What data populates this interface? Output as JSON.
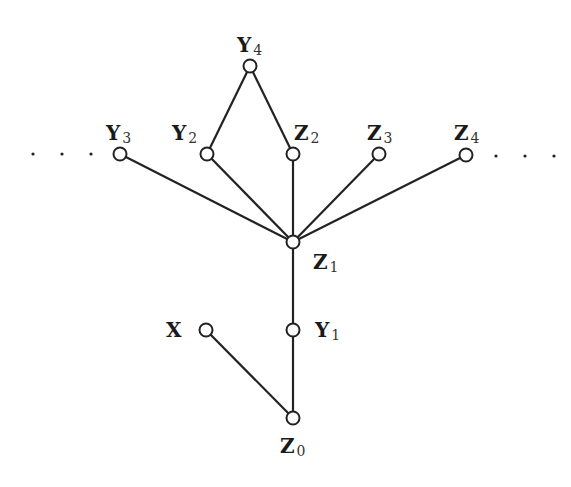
{
  "diagram": {
    "type": "graph",
    "nodes": [
      {
        "id": "Y4",
        "base": "Y",
        "sub": "4",
        "x": 250,
        "y": 66,
        "label_pos": "above"
      },
      {
        "id": "Y3",
        "base": "Y",
        "sub": "3",
        "x": 120,
        "y": 154,
        "label_pos": "above"
      },
      {
        "id": "Y2",
        "base": "Y",
        "sub": "2",
        "x": 207,
        "y": 154,
        "label_pos": "above"
      },
      {
        "id": "Z2",
        "base": "Z",
        "sub": "2",
        "x": 293,
        "y": 154,
        "label_pos": "above"
      },
      {
        "id": "Z3",
        "base": "Z",
        "sub": "3",
        "x": 379,
        "y": 154,
        "label_pos": "above"
      },
      {
        "id": "Z4",
        "base": "Z",
        "sub": "4",
        "x": 466,
        "y": 155,
        "label_pos": "above"
      },
      {
        "id": "Z1",
        "base": "Z",
        "sub": "1",
        "x": 293,
        "y": 242,
        "label_pos": "below-right"
      },
      {
        "id": "X",
        "base": "X",
        "sub": "",
        "x": 206,
        "y": 330,
        "label_pos": "left"
      },
      {
        "id": "Y1",
        "base": "Y",
        "sub": "1",
        "x": 293,
        "y": 330,
        "label_pos": "right"
      },
      {
        "id": "Z0",
        "base": "Z",
        "sub": "0",
        "x": 293,
        "y": 418,
        "label_pos": "below"
      }
    ],
    "edges": [
      [
        "Y4",
        "Y2"
      ],
      [
        "Y4",
        "Z2"
      ],
      [
        "Y3",
        "Z1"
      ],
      [
        "Y2",
        "Z1"
      ],
      [
        "Z2",
        "Z1"
      ],
      [
        "Z3",
        "Z1"
      ],
      [
        "Z4",
        "Z1"
      ],
      [
        "Z1",
        "Y1"
      ],
      [
        "Y1",
        "Z0"
      ],
      [
        "X",
        "Z0"
      ]
    ],
    "ellipsis_left": "· · ·",
    "ellipsis_right": "· · ·",
    "labels": {
      "Y4": {
        "base": "Y",
        "sub": "4"
      },
      "Y3": {
        "base": "Y",
        "sub": "3"
      },
      "Y2": {
        "base": "Y",
        "sub": "2"
      },
      "Z2": {
        "base": "Z",
        "sub": "2"
      },
      "Z3": {
        "base": "Z",
        "sub": "3"
      },
      "Z4": {
        "base": "Z",
        "sub": "4"
      },
      "Z1": {
        "base": "Z",
        "sub": "1"
      },
      "X": {
        "base": "X",
        "sub": ""
      },
      "Y1": {
        "base": "Y",
        "sub": "1"
      },
      "Z0": {
        "base": "Z",
        "sub": "0"
      }
    }
  }
}
